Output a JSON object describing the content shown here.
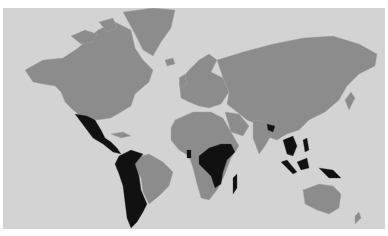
{
  "map": {
    "title_cropped": "",
    "projection": "Mercator",
    "colors": {
      "ocean": "#d3d3d3",
      "land_default": "#8c8c8c",
      "land_highlighted": "#111111",
      "borders": "#a6a6a6"
    },
    "legend": null,
    "highlighted_regions": [
      "Mexico",
      "Guatemala",
      "Honduras",
      "Nicaragua",
      "Costa Rica",
      "Panama",
      "Colombia",
      "Venezuela",
      "Ecuador",
      "Peru",
      "Bolivia",
      "Paraguay",
      "Chile",
      "Argentina",
      "Uruguay",
      "Ghana",
      "Cameroon",
      "Central African Republic",
      "Republic of the Congo",
      "Democratic Republic of the Congo",
      "South Sudan",
      "Ethiopia",
      "Uganda",
      "Kenya",
      "Tanzania",
      "Mozambique",
      "Madagascar",
      "Bangladesh",
      "Thailand",
      "Cambodia",
      "Laos",
      "Vietnam",
      "Indonesia",
      "Papua New Guinea",
      "Philippines"
    ]
  }
}
